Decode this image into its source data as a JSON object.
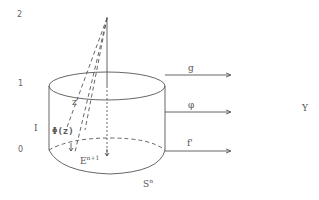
{
  "axis_labels": {
    "top": "2",
    "mid": "1",
    "interval": "I",
    "bottom": "0"
  },
  "labels": {
    "z": "z",
    "phi_z": "Φ(z)",
    "e_base": "E",
    "e_sup": "n+1",
    "s_base": "S",
    "s_sup": "n",
    "g": "g",
    "phi": "φ",
    "f_prime": "f'",
    "y": "Y"
  },
  "colors": {
    "stroke": "#555555",
    "text": "#555555"
  }
}
